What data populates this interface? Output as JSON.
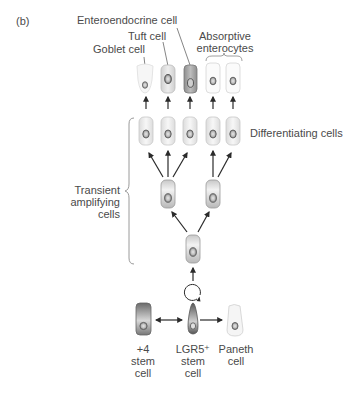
{
  "panel_label": "(b)",
  "labels": {
    "enteroendocrine": "Enteroendocrine cell",
    "tuft": "Tuft cell",
    "goblet": "Goblet cell",
    "absorptive_line1": "Absorptive",
    "absorptive_line2": "enterocytes",
    "differentiating": "Differentiating cells",
    "transient_line1": "Transient",
    "transient_line2": "amplifying",
    "transient_line3": "cells",
    "plus4_line1": "+4",
    "plus4_line2": "stem",
    "plus4_line3": "cell",
    "lgr5_line1": "LGR5⁺",
    "lgr5_line2": "stem",
    "lgr5_line3": "cell",
    "paneth_line1": "Paneth",
    "paneth_line2": "cell"
  },
  "colors": {
    "text": "#4a4a4a",
    "arrow": "#2a2a2a",
    "leader_line": "#666666",
    "brace": "#9a9a9a"
  }
}
